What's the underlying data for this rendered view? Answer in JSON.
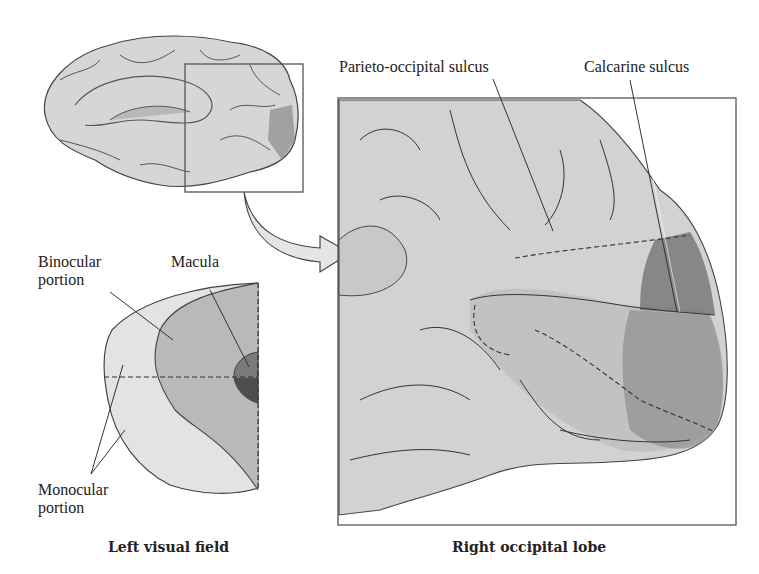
{
  "figure": {
    "panels": [
      {
        "id": "left-visual-field",
        "caption": "Left visual field",
        "labels": {
          "binocular": [
            "Binocular",
            "portion"
          ],
          "macula": "Macula",
          "monocular": [
            "Monocular",
            "portion"
          ]
        }
      },
      {
        "id": "right-occipital-lobe",
        "caption": "Right occipital lobe",
        "labels": {
          "parieto_occipital": "Parieto-occipital sulcus",
          "calcarine": "Calcarine sulcus"
        }
      }
    ],
    "inset": "medial brain view with occipital region boxed",
    "colors": {
      "monocular": "#e3e3e3",
      "binocular": "#b9b9b9",
      "macula": "#6e6e6e",
      "brain": "#d2d2d2",
      "outline": "#333333"
    }
  }
}
